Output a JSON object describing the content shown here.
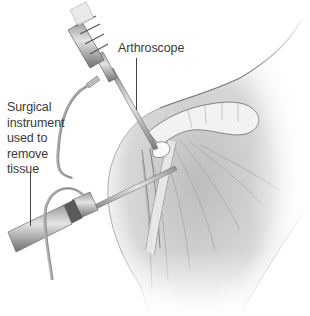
{
  "figure": {
    "labels": {
      "arthroscope": "Arthroscope",
      "instrument_lines": [
        "Surgical",
        "instrument",
        "used to",
        "remove",
        "tissue"
      ]
    },
    "colors": {
      "background": "#ffffff",
      "text": "#3a3a3a",
      "skin_light": "#efefef",
      "skin_mid": "#c8c8c8",
      "skin_dark": "#8a8a8a",
      "instrument_metal": "#b8b8b8"
    }
  }
}
